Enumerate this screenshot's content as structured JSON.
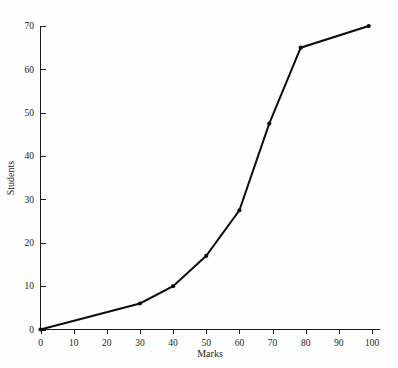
{
  "chart_data": {
    "type": "line",
    "title": "",
    "xlabel": "Marks",
    "ylabel": "Students",
    "xlim": [
      0,
      100
    ],
    "ylim": [
      0,
      70
    ],
    "xticks": [
      0,
      10,
      20,
      30,
      40,
      50,
      60,
      70,
      80,
      90,
      100
    ],
    "yticks": [
      0,
      10,
      20,
      30,
      40,
      50,
      60,
      70
    ],
    "grid": false,
    "legend": false,
    "series": [
      {
        "name": "Cumulative students",
        "marker": "dot",
        "color": "#0d0d0d",
        "x": [
          0,
          30,
          40,
          50,
          60,
          69,
          78.5,
          99
        ],
        "y": [
          0,
          6,
          10,
          17,
          27.5,
          47.5,
          65,
          70
        ]
      }
    ]
  },
  "axes": {
    "x_title": "Marks",
    "y_title": "Students",
    "x_tick_labels": [
      "0",
      "10",
      "20",
      "30",
      "40",
      "50",
      "60",
      "70",
      "80",
      "90",
      "100"
    ],
    "y_tick_labels": [
      "0",
      "10",
      "20",
      "30",
      "40",
      "50",
      "60",
      "70"
    ]
  },
  "header": {
    "cropped_caption": "· ·  ·"
  }
}
